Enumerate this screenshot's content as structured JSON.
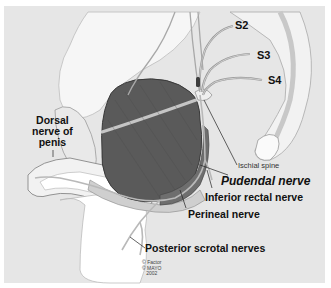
{
  "figure": {
    "background_color": "#e6e6e6",
    "muscle_color": "#5a5a5a",
    "labels": {
      "s2": "S2",
      "s3": "S3",
      "s4": "S4",
      "dorsal_line1": "Dorsal",
      "dorsal_line2": "nerve of",
      "dorsal_line3": "penis",
      "ischial_spine": "Ischial spine",
      "pudendal_nerve": "Pudendal nerve",
      "inferior_rectal_nerve": "Inferior rectal nerve",
      "perineal_nerve": "Perineal nerve",
      "posterior_scrotal_nerves": "Posterior scrotal nerves"
    },
    "credit": {
      "line1": "© Factor",
      "line2": "© MAYO",
      "line3": "2002"
    }
  }
}
